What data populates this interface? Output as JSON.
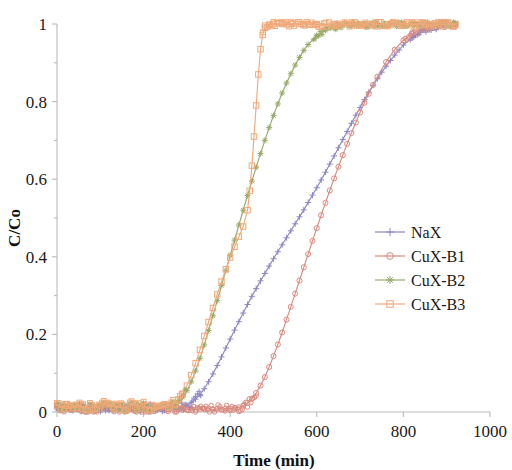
{
  "chart_data": {
    "type": "line",
    "title": "",
    "xlabel": "Time (min)",
    "ylabel": "C/Co",
    "xlim": [
      0,
      1000
    ],
    "ylim": [
      0,
      1
    ],
    "grid": false,
    "legend_position": "right-middle",
    "xticks": [
      "0",
      "200",
      "400",
      "600",
      "800",
      "1000"
    ],
    "xtick_values": [
      0,
      200,
      400,
      600,
      800,
      1000
    ],
    "yticks": [
      "0",
      "0.2",
      "0.4",
      "0.6",
      "0.8",
      "1"
    ],
    "ytick_values": [
      0,
      0.2,
      0.4,
      0.6,
      0.8,
      1
    ],
    "series": [
      {
        "name": "NaX",
        "color": "#8a86c4",
        "marker": "plus",
        "x": [
          0,
          10,
          20,
          30,
          40,
          50,
          60,
          70,
          80,
          90,
          100,
          110,
          120,
          130,
          140,
          150,
          160,
          170,
          180,
          190,
          200,
          210,
          220,
          230,
          240,
          250,
          260,
          270,
          280,
          290,
          300,
          310,
          320,
          330,
          340,
          350,
          360,
          370,
          380,
          390,
          400,
          410,
          420,
          430,
          440,
          450,
          460,
          470,
          480,
          490,
          500,
          510,
          520,
          530,
          540,
          550,
          560,
          570,
          580,
          590,
          600,
          610,
          620,
          630,
          640,
          650,
          660,
          670,
          680,
          690,
          700,
          710,
          720,
          730,
          740,
          750,
          760,
          770,
          780,
          790,
          800,
          820,
          840,
          860,
          880,
          900,
          920
        ],
        "y": [
          0.012,
          0.008,
          0.014,
          0.006,
          0.011,
          0.009,
          0.013,
          0.007,
          0.012,
          0.008,
          0.01,
          0.013,
          0.007,
          0.011,
          0.009,
          0.012,
          0.008,
          0.01,
          0.013,
          0.009,
          0.011,
          0.007,
          0.012,
          0.01,
          0.008,
          0.013,
          0.011,
          0.009,
          0.012,
          0.014,
          0.018,
          0.024,
          0.033,
          0.045,
          0.06,
          0.078,
          0.098,
          0.12,
          0.142,
          0.165,
          0.188,
          0.211,
          0.233,
          0.255,
          0.277,
          0.298,
          0.318,
          0.338,
          0.357,
          0.376,
          0.395,
          0.413,
          0.431,
          0.449,
          0.467,
          0.485,
          0.503,
          0.521,
          0.54,
          0.559,
          0.578,
          0.598,
          0.618,
          0.639,
          0.66,
          0.681,
          0.702,
          0.723,
          0.744,
          0.765,
          0.785,
          0.805,
          0.824,
          0.842,
          0.859,
          0.876,
          0.891,
          0.906,
          0.92,
          0.933,
          0.946,
          0.965,
          0.978,
          0.988,
          0.994,
          0.997,
          0.999
        ]
      },
      {
        "name": "CuX-B1",
        "color": "#d98a80",
        "marker": "circle",
        "x": [
          0,
          10,
          20,
          30,
          40,
          50,
          60,
          70,
          80,
          90,
          100,
          110,
          120,
          130,
          140,
          150,
          160,
          170,
          180,
          190,
          200,
          210,
          220,
          230,
          240,
          250,
          260,
          270,
          280,
          290,
          300,
          310,
          320,
          330,
          340,
          350,
          360,
          370,
          380,
          390,
          400,
          410,
          420,
          430,
          440,
          450,
          460,
          470,
          480,
          490,
          500,
          510,
          520,
          530,
          540,
          550,
          560,
          570,
          580,
          590,
          600,
          610,
          620,
          630,
          640,
          650,
          660,
          670,
          680,
          690,
          700,
          710,
          720,
          730,
          740,
          760,
          780,
          800,
          820,
          840,
          860,
          880,
          900,
          920
        ],
        "y": [
          0.01,
          0.007,
          0.011,
          0.006,
          0.009,
          0.008,
          0.01,
          0.007,
          0.009,
          0.006,
          0.008,
          0.01,
          0.007,
          0.009,
          0.006,
          0.008,
          0.01,
          0.007,
          0.009,
          0.008,
          0.006,
          0.009,
          0.007,
          0.01,
          0.008,
          0.006,
          0.009,
          0.007,
          0.008,
          0.006,
          0.007,
          0.009,
          0.006,
          0.008,
          0.007,
          0.009,
          0.006,
          0.008,
          0.007,
          0.009,
          0.008,
          0.01,
          0.012,
          0.016,
          0.023,
          0.034,
          0.049,
          0.068,
          0.09,
          0.116,
          0.144,
          0.174,
          0.205,
          0.238,
          0.271,
          0.305,
          0.339,
          0.373,
          0.407,
          0.441,
          0.474,
          0.507,
          0.539,
          0.571,
          0.602,
          0.632,
          0.662,
          0.691,
          0.719,
          0.746,
          0.772,
          0.797,
          0.82,
          0.843,
          0.864,
          0.902,
          0.934,
          0.958,
          0.975,
          0.986,
          0.993,
          0.997,
          0.999,
          1.0
        ]
      },
      {
        "name": "CuX-B2",
        "color": "#97ab6b",
        "marker": "star",
        "x": [
          0,
          10,
          20,
          30,
          40,
          50,
          60,
          70,
          80,
          90,
          100,
          110,
          120,
          130,
          140,
          150,
          160,
          170,
          180,
          190,
          200,
          210,
          220,
          230,
          240,
          250,
          260,
          270,
          280,
          290,
          300,
          310,
          320,
          330,
          340,
          350,
          360,
          370,
          380,
          390,
          400,
          410,
          420,
          430,
          440,
          450,
          460,
          470,
          480,
          490,
          500,
          510,
          520,
          530,
          540,
          550,
          560,
          570,
          580,
          600,
          620,
          650,
          680,
          710,
          740,
          770,
          800,
          830,
          860,
          890,
          920
        ],
        "y": [
          0.014,
          0.01,
          0.016,
          0.009,
          0.013,
          0.011,
          0.015,
          0.01,
          0.014,
          0.011,
          0.013,
          0.016,
          0.01,
          0.014,
          0.012,
          0.015,
          0.011,
          0.013,
          0.016,
          0.012,
          0.014,
          0.01,
          0.015,
          0.013,
          0.011,
          0.016,
          0.014,
          0.018,
          0.026,
          0.038,
          0.055,
          0.078,
          0.106,
          0.138,
          0.173,
          0.21,
          0.248,
          0.287,
          0.326,
          0.365,
          0.404,
          0.443,
          0.482,
          0.52,
          0.558,
          0.595,
          0.631,
          0.666,
          0.7,
          0.733,
          0.764,
          0.794,
          0.822,
          0.848,
          0.872,
          0.894,
          0.914,
          0.932,
          0.947,
          0.97,
          0.984,
          0.994,
          0.998,
          1.0,
          1.0,
          1.0,
          1.0,
          1.0,
          1.0,
          1.0,
          1.0
        ]
      },
      {
        "name": "CuX-B3",
        "color": "#f0a878",
        "marker": "square",
        "x": [
          0,
          10,
          20,
          30,
          40,
          50,
          60,
          70,
          80,
          90,
          100,
          110,
          120,
          130,
          140,
          150,
          160,
          170,
          180,
          190,
          200,
          210,
          220,
          230,
          240,
          250,
          260,
          270,
          280,
          290,
          300,
          310,
          320,
          330,
          340,
          350,
          360,
          370,
          380,
          390,
          400,
          410,
          420,
          430,
          440,
          445,
          450,
          455,
          460,
          465,
          470,
          475,
          480,
          490,
          500,
          520,
          540,
          570,
          600,
          640,
          680,
          720,
          760,
          800,
          840,
          880,
          920
        ],
        "y": [
          0.018,
          0.012,
          0.02,
          0.01,
          0.016,
          0.013,
          0.019,
          0.011,
          0.017,
          0.013,
          0.016,
          0.02,
          0.012,
          0.017,
          0.014,
          0.018,
          0.013,
          0.016,
          0.02,
          0.014,
          0.017,
          0.012,
          0.018,
          0.015,
          0.013,
          0.019,
          0.016,
          0.022,
          0.032,
          0.047,
          0.068,
          0.095,
          0.126,
          0.16,
          0.196,
          0.232,
          0.268,
          0.303,
          0.336,
          0.368,
          0.398,
          0.426,
          0.452,
          0.478,
          0.52,
          0.57,
          0.635,
          0.71,
          0.79,
          0.87,
          0.935,
          0.972,
          0.99,
          0.998,
          1.0,
          1.0,
          1.0,
          1.0,
          1.0,
          1.0,
          1.0,
          1.0,
          1.0,
          1.0,
          1.0,
          1.0,
          1.0
        ]
      }
    ]
  },
  "axes": {
    "x_title": "Time (min)",
    "y_title": "C/Co"
  },
  "legend": {
    "entries": [
      {
        "label": "NaX",
        "color": "#8a86c4",
        "marker": "plus"
      },
      {
        "label": "CuX-B1",
        "color": "#d98a80",
        "marker": "circle"
      },
      {
        "label": "CuX-B2",
        "color": "#97ab6b",
        "marker": "star"
      },
      {
        "label": "CuX-B3",
        "color": "#f0a878",
        "marker": "square"
      }
    ]
  }
}
